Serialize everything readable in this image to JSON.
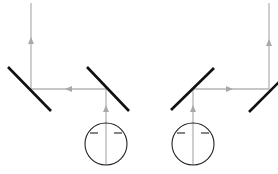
{
  "diagram": {
    "type": "optical beam-path schematic",
    "colors": {
      "beam": "#b5b5b5",
      "arrow": "#a8a8a8",
      "mirror": "#111111",
      "source": "#222222",
      "background": "#ffffff"
    },
    "left_setup": {
      "source": {
        "cx": 106,
        "cy": 144,
        "r": 21
      },
      "mirrors": [
        {
          "id": "mirror-1",
          "x1": 8,
          "y1": 67,
          "x2": 51,
          "y2": 111
        },
        {
          "id": "mirror-2",
          "x1": 87,
          "y1": 67,
          "x2": 129,
          "y2": 111
        }
      ],
      "beam_path": [
        [
          106,
          165
        ],
        [
          106,
          89
        ],
        [
          31,
          89
        ],
        [
          31,
          3
        ]
      ],
      "arrows": [
        {
          "x": 106,
          "y": 110,
          "dir": "up"
        },
        {
          "x": 70,
          "y": 89,
          "dir": "left"
        },
        {
          "x": 31,
          "y": 42,
          "dir": "up"
        }
      ]
    },
    "right_setup": {
      "source": {
        "cx": 193,
        "cy": 144,
        "r": 21
      },
      "mirrors": [
        {
          "id": "mirror-3",
          "x1": 171,
          "y1": 110,
          "x2": 214,
          "y2": 68
        },
        {
          "id": "mirror-4",
          "x1": 249,
          "y1": 112,
          "x2": 280,
          "y2": 81
        }
      ],
      "beam_path": [
        [
          193,
          165
        ],
        [
          193,
          89
        ],
        [
          269,
          89
        ],
        [
          269,
          3
        ]
      ],
      "arrows": [
        {
          "x": 193,
          "y": 110,
          "dir": "up"
        },
        {
          "x": 229,
          "y": 89,
          "dir": "right"
        },
        {
          "x": 269,
          "y": 44,
          "dir": "up"
        }
      ]
    }
  }
}
